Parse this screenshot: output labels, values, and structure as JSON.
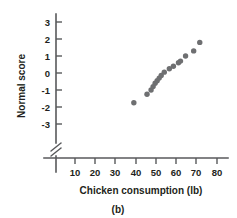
{
  "figure": {
    "caption": "(b)",
    "background_color": "#ffffff",
    "axis_color": "#58595b",
    "point_color": "#6e6f71"
  },
  "chart_data": {
    "type": "scatter",
    "title": "",
    "xlabel": "Chicken consumption (lb)",
    "ylabel": "Normal score",
    "xlim": [
      0,
      85
    ],
    "ylim": [
      -3.6,
      3.6
    ],
    "xticks": [
      10,
      20,
      30,
      40,
      50,
      60,
      70,
      80
    ],
    "xtick_labels": [
      "10",
      "20",
      "30",
      "40",
      "50",
      "60",
      "70",
      "80"
    ],
    "yticks": [
      -3,
      -2,
      -1,
      0,
      1,
      2,
      3
    ],
    "ytick_labels": [
      "-3",
      "-2",
      "-1",
      "0",
      "1",
      "2",
      "3"
    ],
    "grid": false,
    "legend": false,
    "axis_break": {
      "axis": "x",
      "position": "origin",
      "symbol": "double-slash"
    },
    "series": [
      {
        "name": "Chicken consumption normal probability plot",
        "marker": "circle",
        "color": "#6e6f71",
        "x": [
          39.0,
          45.5,
          47.5,
          48.5,
          49.5,
          50.5,
          51.5,
          52.5,
          54.0,
          56.5,
          58.5,
          61.0,
          62.0,
          64.5,
          68.5,
          71.5
        ],
        "y": [
          -1.75,
          -1.25,
          -1.0,
          -0.8,
          -0.6,
          -0.45,
          -0.3,
          -0.15,
          0.05,
          0.25,
          0.4,
          0.6,
          0.7,
          1.0,
          1.3,
          1.8
        ]
      }
    ]
  }
}
